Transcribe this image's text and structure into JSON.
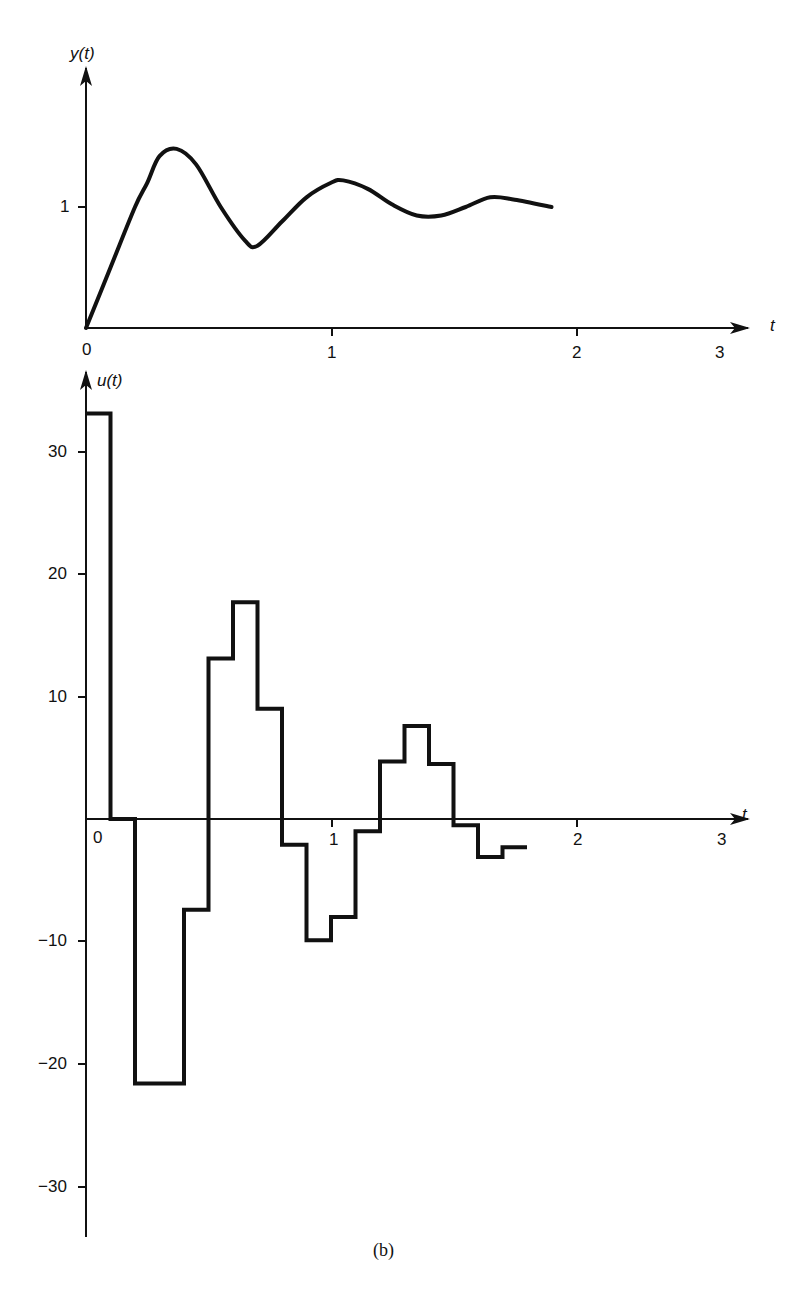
{
  "figure": {
    "caption": "(b)"
  },
  "chart_data": [
    {
      "type": "line",
      "title": "",
      "xlabel": "t",
      "ylabel": "y(t)",
      "x_ticks": [
        "0",
        "1",
        "2",
        "3"
      ],
      "y_ticks": [
        "1"
      ],
      "xlim": [
        0,
        3
      ],
      "ylim": [
        0,
        1.8
      ],
      "grid": false,
      "series": [
        {
          "name": "y(t)",
          "x": [
            0,
            0.1,
            0.2,
            0.25,
            0.3,
            0.37,
            0.45,
            0.55,
            0.65,
            0.7,
            0.8,
            0.9,
            1.0,
            1.05,
            1.15,
            1.25,
            1.35,
            1.45,
            1.55,
            1.65,
            1.75,
            1.9
          ],
          "y": [
            0,
            0.5,
            1.0,
            1.2,
            1.42,
            1.48,
            1.35,
            1.0,
            0.72,
            0.68,
            0.88,
            1.08,
            1.2,
            1.22,
            1.15,
            1.02,
            0.93,
            0.93,
            1.0,
            1.08,
            1.06,
            1.0
          ]
        }
      ]
    },
    {
      "type": "line",
      "title": "",
      "xlabel": "t",
      "ylabel": "u(t)",
      "x_ticks": [
        "0",
        "1",
        "2",
        "3"
      ],
      "y_ticks": [
        "30",
        "20",
        "10",
        "-10",
        "-20",
        "-30"
      ],
      "xlim": [
        0,
        3
      ],
      "ylim": [
        -34,
        36
      ],
      "grid": false,
      "step": true,
      "series": [
        {
          "name": "u(t)",
          "t_start": [
            0,
            0.1,
            0.2,
            0.3,
            0.4,
            0.5,
            0.6,
            0.7,
            0.8,
            0.9,
            1.0,
            1.1,
            1.2,
            1.3,
            1.4,
            1.5,
            1.6,
            1.7
          ],
          "values": [
            33.1,
            0.0,
            -21.6,
            -21.6,
            -7.4,
            13.1,
            17.7,
            9.0,
            -2.1,
            -9.9,
            -8.0,
            -1.0,
            4.7,
            7.6,
            4.5,
            -0.5,
            -3.1,
            -2.3
          ],
          "t_end": 1.8
        }
      ]
    }
  ],
  "labels": {
    "top": {
      "ylabel": "y(t)",
      "xlabel": "t",
      "x0": "0",
      "x1": "1",
      "x2": "2",
      "x3": "3",
      "y1": "1"
    },
    "bottom": {
      "ylabel": "u(t)",
      "xlabel": "t",
      "x0": "0",
      "x1": "1",
      "x2": "2",
      "x3": "3",
      "y30": "30",
      "y20": "20",
      "y10": "10",
      "ym10": "−10",
      "ym20": "−20",
      "ym30": "−30"
    }
  }
}
